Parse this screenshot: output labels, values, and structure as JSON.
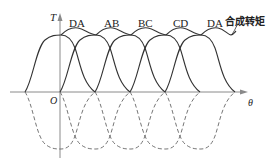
{
  "diagram": {
    "axes": {
      "y_label": "T",
      "x_label": "θ",
      "origin_label": "O"
    },
    "phase_labels": [
      "DA",
      "AB",
      "BC",
      "CD",
      "DA"
    ],
    "resultant_label": "合成转矩",
    "colors": {
      "solid_curve": "#333333",
      "dashed_curve": "#666666",
      "axis": "#8a8a8a",
      "text": "#222222"
    },
    "curves": {
      "solid_count": 5,
      "dashed_count": 5
    }
  }
}
